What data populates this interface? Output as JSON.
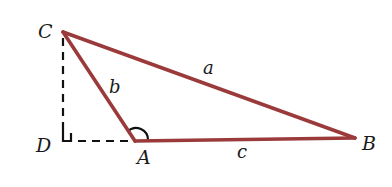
{
  "diagram": {
    "type": "obtuse triangle with altitude",
    "vertices": [
      {
        "name": "C",
        "label": "C"
      },
      {
        "name": "D",
        "label": "D"
      },
      {
        "name": "A",
        "label": "A"
      },
      {
        "name": "B",
        "label": "B"
      }
    ],
    "sides": [
      {
        "name": "a",
        "label": "a",
        "from": "C",
        "to": "B"
      },
      {
        "name": "b",
        "label": "b",
        "from": "C",
        "to": "A"
      },
      {
        "name": "c",
        "label": "c",
        "from": "A",
        "to": "B"
      }
    ],
    "construction_lines": [
      {
        "from": "C",
        "to": "D",
        "style": "dashed"
      },
      {
        "from": "D",
        "to": "A",
        "style": "dashed"
      }
    ],
    "markers": [
      {
        "type": "right-angle",
        "at": "D"
      },
      {
        "type": "angle-arc",
        "at": "A"
      }
    ],
    "colors": {
      "triangle_edges": "#9b3a3a",
      "construction": "#111111",
      "text": "#1a1a1a"
    }
  }
}
